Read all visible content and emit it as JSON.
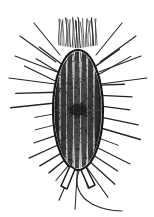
{
  "figure": {
    "caption": "",
    "domain_kind": "scientific-illustration",
    "canvas": {
      "width": 154,
      "height": 217,
      "background": "#ffffff"
    },
    "ink_color": "#1a1a1a",
    "mid_ink_color": "#454545",
    "light_ink_color": "#6f6f6f",
    "stipple_color": "#242424"
  },
  "organism": {
    "body": {
      "label": "ovoid cell body",
      "center_x": 78,
      "center_y": 110,
      "radius_x": 25,
      "radius_y": 60,
      "top_y": 47,
      "bottom_y": 172,
      "left_x": 53,
      "right_x": 103,
      "outline_width": 2.2
    },
    "ridges": {
      "label": "longitudinal kineties / ridges",
      "count": 7,
      "offsets_x": [
        -21,
        -14.5,
        -8,
        -1,
        6,
        12.5,
        19
      ],
      "band_color": "#232323"
    },
    "girdle_lines": {
      "label": "transverse girdle lines",
      "y_values": [
        78,
        110,
        142
      ],
      "color": "#555555",
      "width": 0.7
    },
    "nucleus": {
      "label": "macronucleus",
      "center_x": 78,
      "center_y": 110,
      "radius_x": 9,
      "radius_y": 6,
      "color": "#1f1f1f"
    },
    "apical_tuft": {
      "label": "apical cilia tuft",
      "count": 24,
      "x_start": 59,
      "x_end": 97,
      "y_top": 17,
      "y_bottom": 48
    },
    "spines": {
      "label": "radiating spines / setae",
      "count": 34,
      "min_length": 18,
      "max_length": 44,
      "width": 1.1
    },
    "posterior_spurs": {
      "label": "posterior spurs",
      "count": 2,
      "left": {
        "tip_x": 65,
        "tip_y": 188
      },
      "right": {
        "tip_x": 93,
        "tip_y": 187
      }
    },
    "flagellum": {
      "label": "trailing flagellum",
      "start_x": 79,
      "start_y": 172,
      "end_x": 122,
      "end_y": 211,
      "width": 1.1
    }
  }
}
